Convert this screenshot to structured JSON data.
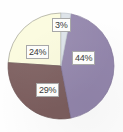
{
  "chart_data": {
    "type": "pie",
    "title": "",
    "subtitle": "",
    "xlabel": "",
    "ylabel": "",
    "legend": "none",
    "grid": false,
    "labels_shown": "percentage",
    "total_percent": 100,
    "start_angle_deg": 0,
    "direction": "clockwise",
    "center": {
      "x": 61,
      "y": 66
    },
    "radius": 53,
    "categories": [
      "Segment 1",
      "Segment 2",
      "Segment 3",
      "Segment 4"
    ],
    "values": [
      3,
      44,
      29,
      24
    ],
    "slices": [
      {
        "label": "3%",
        "value": 3,
        "color": "#dce2e8",
        "start_angle_deg": 0,
        "end_angle_deg": 10.8,
        "label_x": 52,
        "label_y": 18
      },
      {
        "label": "44%",
        "value": 44,
        "color": "#9386ac",
        "start_angle_deg": 10.8,
        "end_angle_deg": 169.2,
        "label_x": 72,
        "label_y": 51
      },
      {
        "label": "29%",
        "value": 29,
        "color": "#7c5e5e",
        "start_angle_deg": 169.2,
        "end_angle_deg": 273.6,
        "label_x": 36,
        "label_y": 83
      },
      {
        "label": "24%",
        "value": 24,
        "color": "#fbfbdd",
        "start_angle_deg": 273.6,
        "end_angle_deg": 360,
        "label_x": 26,
        "label_y": 45
      }
    ]
  },
  "colors": {
    "background": "#fefefe",
    "slice_purple": "#9386ac",
    "slice_brown": "#7c5e5e",
    "slice_cream": "#fbfbdd",
    "slice_pale_blue": "#dce2e8",
    "slice_outline": "#8e8e8e",
    "label_box_fill": "#fdfdfb",
    "label_box_border": "#a8a8a8",
    "label_text": "#3a3a3a"
  }
}
